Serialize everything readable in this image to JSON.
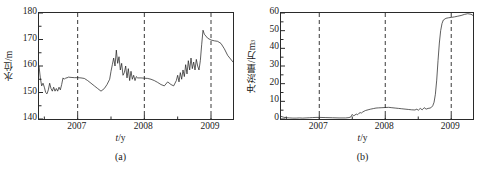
{
  "figure": {
    "panels": [
      {
        "caption": "(a)",
        "xlabel_symbol": "t",
        "xlabel_unit": "y",
        "ylabel": "水位/m",
        "ylabel_main": "水位/m",
        "ylabel_sup": "",
        "yticks": [
          "140",
          "150",
          "160",
          "170",
          "180"
        ],
        "xticks": [
          "2007",
          "2008",
          "2009"
        ]
      },
      {
        "caption": "(b)",
        "xlabel_symbol": "t",
        "xlabel_unit": "y",
        "ylabel": "冲淤量/万m³",
        "ylabel_main": "冲淤量/万m",
        "ylabel_sup": "3",
        "yticks": [
          "0",
          "10",
          "20",
          "30",
          "40",
          "50",
          "60"
        ],
        "xticks": [
          "2007",
          "2008",
          "2009"
        ]
      }
    ]
  },
  "chart_data": [
    {
      "type": "line",
      "panel": "(a)",
      "title": "",
      "xlabel": "t/y",
      "ylabel": "水位/m",
      "xlim": [
        2006.42,
        2009.33
      ],
      "ylim": [
        140,
        180
      ],
      "yticks": [
        140,
        150,
        160,
        170,
        180
      ],
      "xticks": [
        2007,
        2008,
        2009
      ],
      "grid": false,
      "legend": null,
      "annotations": [
        {
          "type": "vline",
          "x": 2007,
          "style": "dashed"
        },
        {
          "type": "vline",
          "x": 2008,
          "style": "dashed"
        },
        {
          "type": "vline",
          "x": 2009,
          "style": "dashed"
        }
      ],
      "series": [
        {
          "name": "水位",
          "x": [
            2006.42,
            2006.44,
            2006.46,
            2006.48,
            2006.5,
            2006.52,
            2006.54,
            2006.56,
            2006.58,
            2006.6,
            2006.62,
            2006.64,
            2006.66,
            2006.68,
            2006.7,
            2006.72,
            2006.74,
            2006.76,
            2006.78,
            2006.8,
            2006.82,
            2006.84,
            2006.86,
            2006.9,
            2006.95,
            2007.0,
            2007.05,
            2007.1,
            2007.15,
            2007.2,
            2007.25,
            2007.3,
            2007.35,
            2007.4,
            2007.44,
            2007.48,
            2007.5,
            2007.52,
            2007.54,
            2007.56,
            2007.58,
            2007.6,
            2007.62,
            2007.64,
            2007.66,
            2007.68,
            2007.7,
            2007.72,
            2007.74,
            2007.76,
            2007.78,
            2007.8,
            2007.82,
            2007.84,
            2007.86,
            2007.88,
            2007.9,
            2007.95,
            2008.0,
            2008.05,
            2008.1,
            2008.15,
            2008.2,
            2008.25,
            2008.3,
            2008.35,
            2008.4,
            2008.44,
            2008.48,
            2008.5,
            2008.52,
            2008.54,
            2008.56,
            2008.58,
            2008.6,
            2008.62,
            2008.64,
            2008.66,
            2008.68,
            2008.7,
            2008.72,
            2008.74,
            2008.76,
            2008.78,
            2008.8,
            2008.82,
            2008.84,
            2008.86,
            2008.88,
            2008.9,
            2008.95,
            2009.0,
            2009.05,
            2009.1,
            2009.15,
            2009.2,
            2009.25,
            2009.33
          ],
          "y": [
            160.0,
            155.5,
            152.5,
            153.5,
            152.0,
            150.0,
            149.5,
            151.0,
            153.5,
            151.5,
            150.5,
            152.0,
            150.5,
            151.5,
            150.5,
            152.0,
            151.0,
            153.0,
            155.5,
            155.0,
            155.5,
            155.5,
            155.8,
            155.7,
            155.6,
            155.6,
            155.5,
            155.3,
            154.5,
            153.5,
            152.5,
            151.5,
            150.5,
            151.5,
            153.0,
            155.0,
            158.0,
            160.5,
            163.0,
            160.0,
            166.0,
            161.0,
            163.5,
            158.5,
            161.0,
            156.5,
            157.5,
            160.0,
            155.5,
            159.0,
            154.5,
            158.0,
            155.0,
            156.5,
            154.5,
            156.0,
            155.5,
            155.5,
            155.4,
            155.3,
            155.0,
            154.5,
            153.8,
            153.0,
            152.5,
            154.0,
            153.0,
            152.5,
            154.5,
            156.5,
            154.0,
            157.5,
            155.0,
            158.5,
            156.0,
            160.5,
            157.0,
            162.0,
            158.5,
            163.0,
            159.0,
            161.5,
            158.5,
            162.5,
            160.0,
            158.5,
            162.0,
            168.0,
            173.5,
            172.0,
            170.5,
            169.8,
            169.5,
            169.3,
            168.5,
            166.5,
            164.0,
            161.5
          ]
        }
      ]
    },
    {
      "type": "line",
      "panel": "(b)",
      "title": "",
      "xlabel": "t/y",
      "ylabel": "冲淤量/万m³",
      "xlim": [
        2006.42,
        2009.33
      ],
      "ylim": [
        0,
        60
      ],
      "yticks": [
        0,
        10,
        20,
        30,
        40,
        50,
        60
      ],
      "xticks": [
        2007,
        2008,
        2009
      ],
      "grid": false,
      "legend": null,
      "annotations": [
        {
          "type": "vline",
          "x": 2007,
          "style": "dashed"
        },
        {
          "type": "vline",
          "x": 2008,
          "style": "dashed"
        },
        {
          "type": "vline",
          "x": 2009,
          "style": "dashed"
        }
      ],
      "series": [
        {
          "name": "冲淤量",
          "x": [
            2006.42,
            2006.46,
            2006.5,
            2006.55,
            2006.6,
            2006.65,
            2006.7,
            2006.75,
            2006.8,
            2006.85,
            2006.9,
            2006.95,
            2007.0,
            2007.1,
            2007.2,
            2007.3,
            2007.4,
            2007.45,
            2007.48,
            2007.5,
            2007.52,
            2007.54,
            2007.56,
            2007.58,
            2007.6,
            2007.62,
            2007.64,
            2007.66,
            2007.68,
            2007.7,
            2007.74,
            2007.78,
            2007.82,
            2007.86,
            2007.9,
            2007.95,
            2008.0,
            2008.05,
            2008.1,
            2008.15,
            2008.2,
            2008.25,
            2008.3,
            2008.35,
            2008.4,
            2008.45,
            2008.48,
            2008.5,
            2008.53,
            2008.56,
            2008.59,
            2008.62,
            2008.65,
            2008.68,
            2008.7,
            2008.72,
            2008.74,
            2008.76,
            2008.78,
            2008.8,
            2008.82,
            2008.84,
            2008.86,
            2008.88,
            2008.92,
            2008.96,
            2009.0,
            2009.05,
            2009.1,
            2009.15,
            2009.2,
            2009.25,
            2009.3,
            2009.33
          ],
          "y": [
            1.5,
            1.0,
            0.7,
            0.6,
            0.5,
            0.5,
            0.6,
            0.5,
            0.6,
            0.7,
            0.8,
            0.9,
            0.9,
            0.8,
            0.7,
            0.6,
            0.6,
            0.8,
            1.2,
            2.6,
            1.8,
            2.2,
            2.8,
            2.4,
            3.2,
            3.6,
            3.4,
            4.0,
            4.4,
            4.8,
            5.2,
            5.6,
            5.9,
            6.2,
            6.3,
            6.4,
            6.5,
            6.6,
            6.4,
            6.2,
            6.0,
            5.8,
            5.6,
            5.4,
            5.2,
            5.1,
            5.6,
            4.9,
            6.0,
            5.2,
            6.4,
            5.6,
            6.0,
            6.2,
            6.6,
            7.5,
            9.5,
            14.0,
            22.0,
            33.0,
            43.0,
            50.0,
            54.0,
            56.0,
            57.0,
            57.3,
            57.5,
            57.8,
            58.2,
            58.6,
            59.2,
            59.6,
            59.3,
            58.6
          ]
        }
      ]
    }
  ]
}
